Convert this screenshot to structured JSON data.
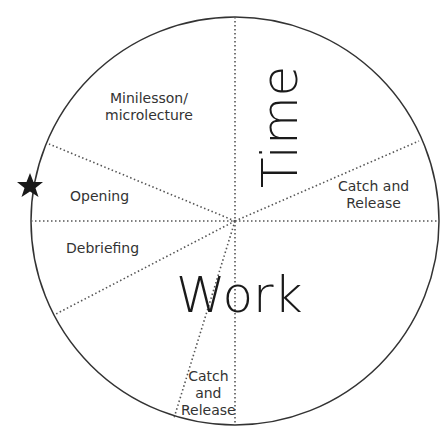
{
  "diagram": {
    "type": "circle-segments",
    "center_label_horizontal": "Work",
    "center_label_vertical": "Time",
    "marker": "star-icon",
    "segments": [
      {
        "label_line1": "Minilesson/",
        "label_line2": "microlecture"
      },
      {
        "label_line1": "Catch and",
        "label_line2": "Release"
      },
      {
        "label_line1": "Opening"
      },
      {
        "label_line1": "Debriefing"
      },
      {
        "label_line1": "Catch",
        "label_line2": "and",
        "label_line3": "Release"
      }
    ],
    "colors": {
      "line": "#333333",
      "text": "#333333",
      "star": "#1a1a1a"
    }
  }
}
